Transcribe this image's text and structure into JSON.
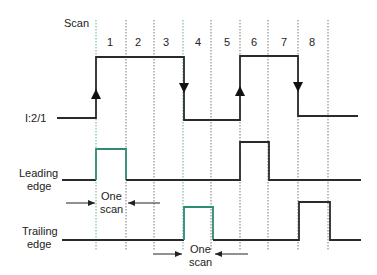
{
  "diagram": {
    "scan_label": "Scan",
    "scan_numbers": [
      "1",
      "2",
      "3",
      "4",
      "5",
      "6",
      "7",
      "8"
    ],
    "signals": {
      "input": {
        "label": "I:2/1"
      },
      "leading": {
        "label_line1": "Leading",
        "label_line2": "edge"
      },
      "trailing": {
        "label_line1": "Trailing",
        "label_line2": "edge"
      }
    },
    "annotations": {
      "leading_one_scan_line1": "One",
      "leading_one_scan_line2": "scan",
      "trailing_one_scan_line1": "One",
      "trailing_one_scan_line2": "scan"
    },
    "colors": {
      "signal": "#2a2a2a",
      "highlight_pulse": "#2e8b74",
      "gridline": "#555555"
    }
  }
}
